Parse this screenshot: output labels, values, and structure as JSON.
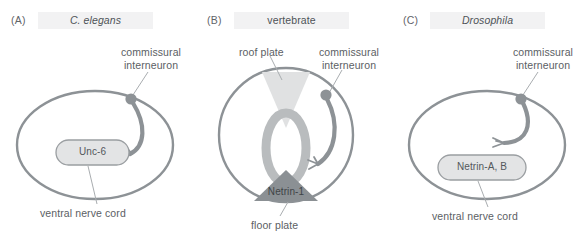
{
  "figure": {
    "background_color": "#ffffff",
    "outline_color": "#8d9296",
    "axon_color": "#8d9296",
    "soma_color": "#8d9296",
    "text_color": "#5b6064",
    "title_band_color": "#f2f2f3",
    "source_box_fill": "#e3e4e5",
    "roof_plate_fill": "#e0e1e2",
    "floor_plate_fill": "#8b9094",
    "neural_tube_fill": "#b9bcbe",
    "leader_color": "#a9adb0"
  },
  "panels": [
    {
      "letter": "(A)",
      "title": "C. elegans",
      "title_italic": true,
      "labels": {
        "neuron": "commissural\ninterneuron",
        "neuron_line1": "commissural",
        "neuron_line2": "interneuron",
        "source_box": "Unc-6",
        "bottom": "ventral nerve cord"
      }
    },
    {
      "letter": "(B)",
      "title": "vertebrate",
      "title_italic": false,
      "labels": {
        "neuron_line1": "commissural",
        "neuron_line2": "interneuron",
        "roof_plate": "roof plate",
        "source_box": "Netrin-1",
        "bottom": "floor plate"
      }
    },
    {
      "letter": "(C)",
      "title": "Drosophila",
      "title_italic": true,
      "labels": {
        "neuron_line1": "commissural",
        "neuron_line2": "interneuron",
        "source_box": "Netrin-A, B",
        "bottom": "ventral nerve cord"
      }
    }
  ]
}
